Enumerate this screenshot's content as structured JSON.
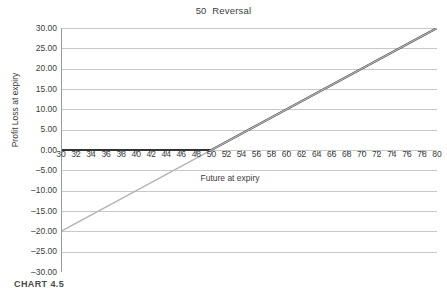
{
  "chart_data": {
    "type": "line",
    "title": "50  Reversal",
    "xlabel": "Future at expiry",
    "ylabel": "Profit Loss at expiry",
    "xlim": [
      30,
      80
    ],
    "ylim": [
      -30,
      30
    ],
    "x_ticks": [
      30,
      32,
      34,
      36,
      38,
      40,
      42,
      44,
      46,
      48,
      50,
      52,
      54,
      56,
      58,
      60,
      62,
      64,
      66,
      68,
      70,
      72,
      74,
      76,
      78,
      80
    ],
    "y_ticks": [
      "30.00",
      "25.00",
      "20.00",
      "15.00",
      "10.00",
      "5.00",
      "0.00",
      "-5.00",
      "-10.00",
      "-15.00",
      "-20.00",
      "-25.00",
      "-30.00"
    ],
    "y_tick_values": [
      30,
      25,
      20,
      15,
      10,
      5,
      0,
      -5,
      -10,
      -15,
      -20,
      -25,
      -30
    ],
    "grid": true,
    "grid_axis": "y",
    "legend": null,
    "series": [
      {
        "name": "call-payoff",
        "color": "#333333",
        "width": 2.1,
        "points": [
          [
            30,
            0
          ],
          [
            50,
            0
          ],
          [
            80,
            30
          ]
        ]
      },
      {
        "name": "reversal-payoff",
        "color": "#b4b4b4",
        "width": 1.3,
        "points": [
          [
            30,
            -20
          ],
          [
            80,
            30
          ]
        ]
      }
    ]
  },
  "caption": {
    "text": "CHART 4.5"
  }
}
